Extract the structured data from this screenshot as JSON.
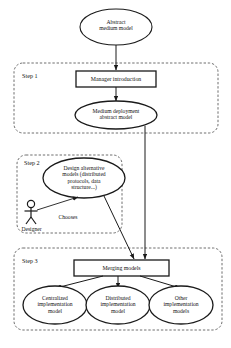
{
  "diagram": {
    "type": "uml-activity-diagram",
    "colors": {
      "stroke": "#1a1a1a",
      "fill": "#ffffff",
      "dashed_group": "#4a4a4a",
      "text": "#111111"
    }
  },
  "start_node": {
    "label": "Abstract\nmedium model",
    "shape": "ellipse"
  },
  "steps": [
    {
      "id": "step-1",
      "label": "Step 1",
      "nodes": [
        {
          "id": "manager-introduction",
          "label": "Manager introduction",
          "shape": "rectangle"
        },
        {
          "id": "medium-deployment-abstract-model",
          "label": "Medium deployment\nabstract model",
          "shape": "ellipse"
        }
      ]
    },
    {
      "id": "step-2",
      "label": "Step 2",
      "nodes": [
        {
          "id": "design-alternative-models",
          "label": "Design alternative\nmodels (distributed\nprotocols, data\nstructure...)",
          "shape": "ellipse"
        }
      ],
      "actor": {
        "id": "designer",
        "label": "Designer",
        "association_label": "Chooses"
      }
    },
    {
      "id": "step-3",
      "label": "Step 3",
      "nodes": [
        {
          "id": "merging-models",
          "label": "Merging models",
          "shape": "rectangle"
        },
        {
          "id": "centralized-implementation-model",
          "label": "Centralized\nimplementation\nmodel",
          "shape": "ellipse"
        },
        {
          "id": "distributed-implementation-model",
          "label": "Distributed\nimplementation\nmodel",
          "shape": "ellipse"
        },
        {
          "id": "other-implementation-models",
          "label": "Other\nimplementation\nmodels",
          "shape": "ellipse"
        }
      ]
    }
  ]
}
